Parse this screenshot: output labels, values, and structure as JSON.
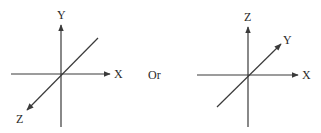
{
  "diagram": {
    "separator_text": "Or",
    "left": {
      "name": "y-up-coordinate-system",
      "axes": [
        {
          "label": "X",
          "direction": "right"
        },
        {
          "label": "Y",
          "direction": "up"
        },
        {
          "label": "Z",
          "direction": "toward-viewer (down-left)"
        }
      ]
    },
    "right": {
      "name": "z-up-coordinate-system",
      "axes": [
        {
          "label": "X",
          "direction": "right"
        },
        {
          "label": "Y",
          "direction": "into-page (up-right)"
        },
        {
          "label": "Z",
          "direction": "up"
        }
      ]
    },
    "colors": {
      "line": "#3a3a3a",
      "text": "#2a2a2a",
      "background": "#ffffff"
    }
  }
}
